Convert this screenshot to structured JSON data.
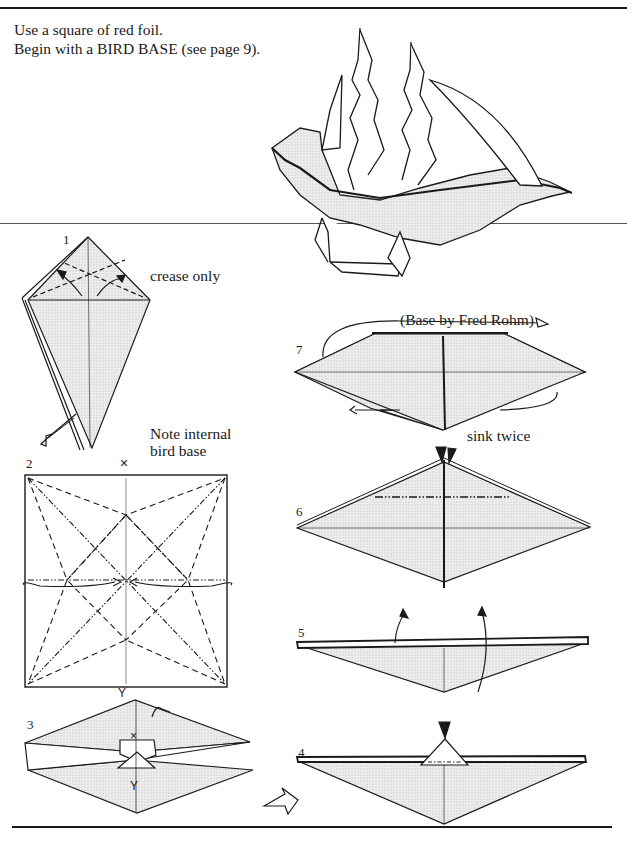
{
  "page": {
    "intro": {
      "line1": "Use a square of red foil.",
      "line2": "Begin with a BIRD BASE (see page 9)."
    },
    "credit": "(Base by Fred Rohm)",
    "fill_color": "#e6e6e6",
    "line_color": "#1a1a1a"
  },
  "steps": [
    {
      "number": "1",
      "annotation": "crease only"
    },
    {
      "number": "2",
      "annotation_line1": "Note internal",
      "annotation_line2": "bird base",
      "marks": [
        "X",
        "Y"
      ]
    },
    {
      "number": "3",
      "marks": [
        "X",
        "Y"
      ]
    },
    {
      "number": "4"
    },
    {
      "number": "5"
    },
    {
      "number": "6",
      "annotation": "sink twice"
    },
    {
      "number": "7"
    }
  ],
  "icons": {
    "ship": "finished-ship-model",
    "arrow": "fold-arrow",
    "sink": "sink-arrowhead",
    "turn": "turn-over-arrow"
  }
}
